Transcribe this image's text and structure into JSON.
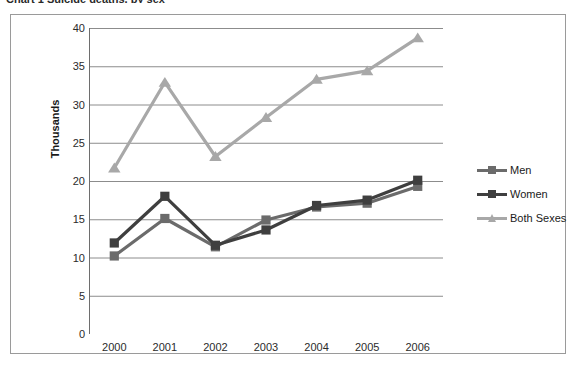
{
  "top_cut_text": "Chart 1  Suicide deaths, by sex",
  "chart_data": {
    "type": "line",
    "title": "",
    "xlabel": "",
    "ylabel": "Thousands",
    "categories": [
      "2000",
      "2001",
      "2002",
      "2003",
      "2004",
      "2005",
      "2006"
    ],
    "ylim": [
      0,
      40
    ],
    "y_ticks": [
      0,
      5,
      10,
      15,
      20,
      25,
      30,
      35,
      40
    ],
    "grid": "horizontal",
    "legend_position": "right",
    "series": [
      {
        "name": "Men",
        "color": "#6b6b6b",
        "marker": "square",
        "values": [
          10.2,
          15.1,
          11.4,
          14.9,
          16.6,
          17.1,
          19.3
        ]
      },
      {
        "name": "Women",
        "color": "#3f3f3f",
        "marker": "square",
        "values": [
          11.9,
          18.0,
          11.6,
          13.6,
          16.8,
          17.5,
          20.1
        ]
      },
      {
        "name": "Both Sexes",
        "color": "#a8a8a8",
        "marker": "triangle",
        "values": [
          21.7,
          32.9,
          23.2,
          28.3,
          33.3,
          34.4,
          38.7
        ]
      }
    ]
  }
}
